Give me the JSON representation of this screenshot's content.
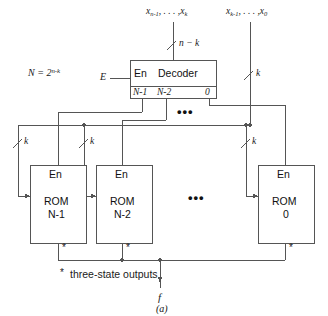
{
  "figure": {
    "caption": "(a)",
    "note_marker": "*",
    "note_text": "three-state outputs"
  },
  "formula": {
    "n_label": "N = 2",
    "n_exponent": "n-k"
  },
  "inputs": {
    "high_group": {
      "prefix": "x",
      "first_sub": "n-1",
      "ellipsis": ", . . . ,",
      "last_sub": "k",
      "width_label": "n − k"
    },
    "low_group": {
      "prefix": "x",
      "first_sub": "k-1",
      "ellipsis": ", . . . ,",
      "last_sub": "0",
      "width_label": "k"
    },
    "enable": "E"
  },
  "decoder": {
    "enable_label": "En",
    "title": "Decoder",
    "outputs": [
      "N-1",
      "N-2",
      "0"
    ],
    "ellipsis": "•••"
  },
  "roms": [
    {
      "enable_label": "En",
      "name": "ROM",
      "index": "N-1",
      "bus_label": "k",
      "out_marker": "*"
    },
    {
      "enable_label": "En",
      "name": "ROM",
      "index": "N-2",
      "bus_label": "k",
      "out_marker": "*"
    },
    {
      "enable_label": "En",
      "name": "ROM",
      "index": "0",
      "bus_label": "k",
      "out_marker": "*"
    }
  ],
  "rom_ellipsis": "•••",
  "output": {
    "label": "f"
  },
  "colors": {
    "line": "#555555",
    "text": "#111111",
    "background": "#ffffff"
  }
}
